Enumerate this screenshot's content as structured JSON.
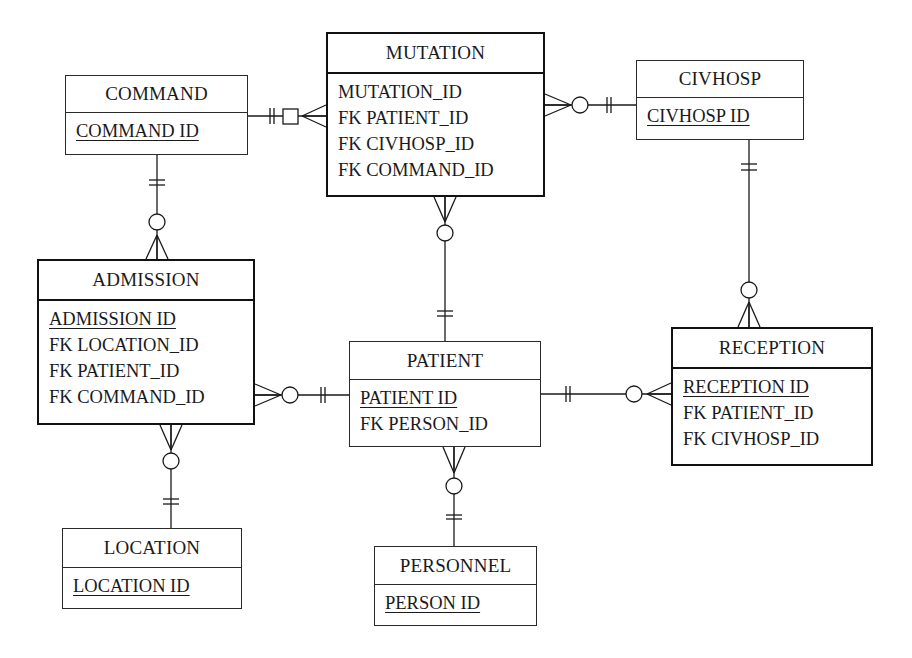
{
  "diagram": {
    "type": "entity-relationship",
    "notation": "crows-foot",
    "line_color": "#1a1a1a",
    "entities": [
      {
        "id": "command",
        "name": "COMMAND",
        "strong": false,
        "box": {
          "x": 65,
          "y": 75,
          "w": 183,
          "h": 80,
          "header_h": 37
        },
        "attributes": [
          {
            "label": "COMMAND_ID",
            "display": "COMMAND ID",
            "pk": true
          }
        ]
      },
      {
        "id": "mutation",
        "name": "MUTATION",
        "strong": true,
        "box": {
          "x": 326,
          "y": 32,
          "w": 219,
          "h": 165,
          "header_h": 40
        },
        "attributes": [
          {
            "label": "MUTATION_ID",
            "display": "MUTATION_ID",
            "pk": false
          },
          {
            "label": "FK PATIENT_ID",
            "display": "FK PATIENT_ID",
            "pk": false
          },
          {
            "label": "FK CIVHOSP_ID",
            "display": "FK CIVHOSP_ID",
            "pk": false
          },
          {
            "label": "FK COMMAND_ID",
            "display": "FK COMMAND_ID",
            "pk": false
          }
        ]
      },
      {
        "id": "civhosp",
        "name": "CIVHOSP",
        "strong": false,
        "box": {
          "x": 636,
          "y": 60,
          "w": 168,
          "h": 80,
          "header_h": 37
        },
        "attributes": [
          {
            "label": "CIVHOSP_ID",
            "display": "CIVHOSP ID",
            "pk": true
          }
        ]
      },
      {
        "id": "admission",
        "name": "ADMISSION",
        "strong": true,
        "box": {
          "x": 37,
          "y": 259,
          "w": 218,
          "h": 166,
          "header_h": 40
        },
        "attributes": [
          {
            "label": "ADMISSION_ID",
            "display": "ADMISSION ID",
            "pk": true
          },
          {
            "label": "FK LOCATION_ID",
            "display": "FK LOCATION_ID",
            "pk": false
          },
          {
            "label": "FK PATIENT_ID",
            "display": "FK PATIENT_ID",
            "pk": false
          },
          {
            "label": "FK COMMAND_ID",
            "display": "FK COMMAND_ID",
            "pk": false
          }
        ]
      },
      {
        "id": "patient",
        "name": "PATIENT",
        "strong": false,
        "box": {
          "x": 349,
          "y": 341,
          "w": 192,
          "h": 106,
          "header_h": 38
        },
        "attributes": [
          {
            "label": "PATIENT_ID",
            "display": "PATIENT ID",
            "pk": true
          },
          {
            "label": "FK PERSON_ID",
            "display": "FK PERSON_ID",
            "pk": false
          }
        ]
      },
      {
        "id": "reception",
        "name": "RECEPTION",
        "strong": true,
        "box": {
          "x": 671,
          "y": 327,
          "w": 202,
          "h": 139,
          "header_h": 40
        },
        "attributes": [
          {
            "label": "RECEPTION_ID",
            "display": "RECEPTION ID",
            "pk": true
          },
          {
            "label": "FK PATIENT_ID",
            "display": "FK PATIENT_ID",
            "pk": false
          },
          {
            "label": "FK CIVHOSP_ID",
            "display": "FK CIVHOSP_ID",
            "pk": false
          }
        ]
      },
      {
        "id": "location",
        "name": "LOCATION",
        "strong": false,
        "box": {
          "x": 62,
          "y": 528,
          "w": 180,
          "h": 81,
          "header_h": 39
        },
        "attributes": [
          {
            "label": "LOCATION_ID",
            "display": "LOCATION ID",
            "pk": true
          }
        ]
      },
      {
        "id": "personnel",
        "name": "PERSONNEL",
        "strong": false,
        "box": {
          "x": 374,
          "y": 546,
          "w": 163,
          "h": 80,
          "header_h": 38
        },
        "attributes": [
          {
            "label": "PERSON_ID",
            "display": "PERSON ID",
            "pk": true
          }
        ]
      }
    ],
    "relationships": [
      {
        "from": "command",
        "to": "mutation",
        "from_cardinality": "exactly-one",
        "to_cardinality": "zero-or-many (square/optional)",
        "orientation": "horizontal",
        "line": {
          "x1": 248,
          "y1": 116,
          "x2": 326,
          "y2": 116
        },
        "one_bars": [
          270,
          274
        ],
        "square": {
          "x": 283,
          "y": 109,
          "size": 15
        },
        "crow": {
          "tip": 302,
          "base": 326,
          "spread": 11
        }
      },
      {
        "from": "civhosp",
        "to": "mutation",
        "from_cardinality": "exactly-one",
        "to_cardinality": "zero-or-many",
        "orientation": "horizontal",
        "line": {
          "x1": 545,
          "y1": 105,
          "x2": 636,
          "y2": 105
        },
        "one_bars": [
          607,
          611
        ],
        "circle": {
          "cx": 580,
          "cy": 105,
          "r": 8
        },
        "crow": {
          "tip": 571,
          "base": 545,
          "spread": 11
        }
      },
      {
        "from": "command",
        "to": "admission",
        "from_cardinality": "exactly-one",
        "to_cardinality": "zero-or-many",
        "orientation": "vertical",
        "line": {
          "x1": 157,
          "y1": 155,
          "x2": 157,
          "y2": 259
        },
        "one_bars": [
          180,
          185
        ],
        "circle": {
          "cx": 157,
          "cy": 222,
          "r": 8
        },
        "crow": {
          "tip": 235,
          "base": 259,
          "spread": 11
        }
      },
      {
        "from": "patient",
        "to": "mutation",
        "from_cardinality": "exactly-one",
        "to_cardinality": "zero-or-many",
        "orientation": "vertical",
        "line": {
          "x1": 445,
          "y1": 197,
          "x2": 445,
          "y2": 341
        },
        "one_bars": [
          311,
          316
        ],
        "circle": {
          "cx": 445,
          "cy": 233,
          "r": 8
        },
        "crow": {
          "tip": 222,
          "base": 197,
          "spread": 11
        }
      },
      {
        "from": "civhosp",
        "to": "reception",
        "from_cardinality": "exactly-one",
        "to_cardinality": "zero-or-many",
        "orientation": "vertical",
        "line": {
          "x1": 749,
          "y1": 140,
          "x2": 749,
          "y2": 327
        },
        "one_bars": [
          164,
          170
        ],
        "circle": {
          "cx": 749,
          "cy": 290,
          "r": 8
        },
        "crow": {
          "tip": 302,
          "base": 327,
          "spread": 11
        }
      },
      {
        "from": "patient",
        "to": "admission",
        "from_cardinality": "exactly-one",
        "to_cardinality": "zero-or-many",
        "orientation": "horizontal",
        "line": {
          "x1": 255,
          "y1": 395,
          "x2": 349,
          "y2": 395
        },
        "one_bars": [
          321,
          325
        ],
        "circle": {
          "cx": 290,
          "cy": 395,
          "r": 8
        },
        "crow": {
          "tip": 281,
          "base": 255,
          "spread": 11
        }
      },
      {
        "from": "patient",
        "to": "reception",
        "from_cardinality": "exactly-one",
        "to_cardinality": "zero-or-many",
        "orientation": "horizontal",
        "line": {
          "x1": 541,
          "y1": 394,
          "x2": 671,
          "y2": 394
        },
        "one_bars": [
          566,
          570
        ],
        "circle": {
          "cx": 634,
          "cy": 394,
          "r": 8
        },
        "crow": {
          "tip": 647,
          "base": 671,
          "spread": 11
        }
      },
      {
        "from": "location",
        "to": "admission",
        "from_cardinality": "exactly-one",
        "to_cardinality": "zero-or-many",
        "orientation": "vertical",
        "line": {
          "x1": 171,
          "y1": 425,
          "x2": 171,
          "y2": 528
        },
        "one_bars": [
          499,
          504
        ],
        "circle": {
          "cx": 171,
          "cy": 461,
          "r": 8
        },
        "crow": {
          "tip": 450,
          "base": 425,
          "spread": 11
        }
      },
      {
        "from": "personnel",
        "to": "patient",
        "from_cardinality": "exactly-one",
        "to_cardinality": "zero-or-many",
        "orientation": "vertical",
        "line": {
          "x1": 454,
          "y1": 447,
          "x2": 454,
          "y2": 546
        },
        "one_bars": [
          515,
          519
        ],
        "circle": {
          "cx": 454,
          "cy": 486,
          "r": 8
        },
        "crow": {
          "tip": 473,
          "base": 447,
          "spread": 11
        }
      }
    ]
  }
}
